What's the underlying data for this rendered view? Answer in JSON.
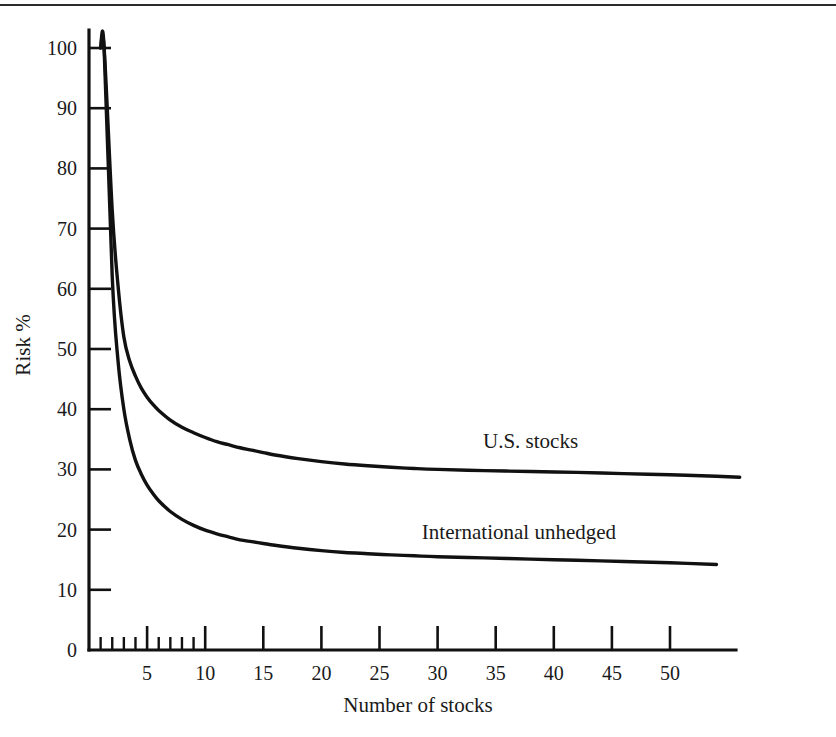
{
  "figure": {
    "background_color": "#ffffff",
    "ink_color": "#111111",
    "top_rule": true
  },
  "chart_data": {
    "type": "line",
    "title": "",
    "subtitle": "",
    "xlabel": "Number of stocks",
    "ylabel": "Risk %",
    "xlim": [
      0,
      56
    ],
    "ylim": [
      0,
      104
    ],
    "grid": false,
    "legend_position": "inline-right",
    "x_ticks_major": [
      5,
      10,
      15,
      20,
      25,
      30,
      35,
      40,
      45,
      50
    ],
    "x_tick_labels": [
      "5",
      "10",
      "15",
      "20",
      "25",
      "30",
      "35",
      "40",
      "45",
      "50"
    ],
    "x_ticks_minor": [
      1,
      2,
      3,
      4,
      6,
      7,
      8,
      9
    ],
    "y_ticks": [
      0,
      10,
      20,
      30,
      40,
      50,
      60,
      70,
      80,
      90,
      100
    ],
    "y_tick_labels": [
      "0",
      "10",
      "20",
      "30",
      "40",
      "50",
      "60",
      "70",
      "80",
      "90",
      "100"
    ],
    "series": [
      {
        "name": "U.S. stocks",
        "label": "U.S. stocks",
        "label_x": 38,
        "label_y": 33.5,
        "x": [
          1,
          1.3,
          2,
          2.5,
          3,
          3.5,
          4,
          4.5,
          5,
          5.5,
          6,
          7,
          8,
          9,
          10,
          11,
          12,
          13,
          14,
          15,
          16,
          18,
          20,
          22,
          24,
          26,
          28,
          30,
          34,
          38,
          42,
          46,
          50,
          54,
          56
        ],
        "values": [
          100,
          100,
          73,
          60.5,
          52,
          48,
          45.5,
          43.5,
          42,
          40.8,
          39.8,
          38.2,
          37,
          36.1,
          35.3,
          34.6,
          34.1,
          33.6,
          33.2,
          32.8,
          32.4,
          31.8,
          31.3,
          30.9,
          30.6,
          30.35,
          30.15,
          30.0,
          29.8,
          29.65,
          29.5,
          29.3,
          29.1,
          28.85,
          28.7
        ]
      },
      {
        "name": "International unhedged",
        "label": "International unhedged",
        "label_x": 37,
        "label_y": 18.5,
        "x": [
          1,
          1.3,
          2,
          2.5,
          3,
          3.5,
          4,
          4.5,
          5,
          5.5,
          6,
          7,
          8,
          9,
          10,
          11,
          12,
          13,
          14,
          15,
          16,
          18,
          20,
          22,
          24,
          26,
          28,
          30,
          34,
          38,
          42,
          46,
          50,
          54
        ],
        "values": [
          100,
          100,
          62,
          48,
          40,
          35,
          31.5,
          29.2,
          27.4,
          26.0,
          24.8,
          23.0,
          21.7,
          20.7,
          19.9,
          19.3,
          18.8,
          18.3,
          18.0,
          17.7,
          17.4,
          16.9,
          16.5,
          16.2,
          16.0,
          15.8,
          15.65,
          15.5,
          15.3,
          15.1,
          14.9,
          14.7,
          14.5,
          14.2
        ]
      }
    ]
  }
}
